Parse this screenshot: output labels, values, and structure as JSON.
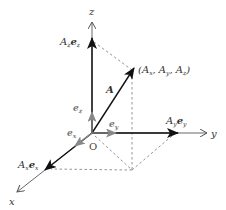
{
  "diagram": {
    "axes": {
      "x_label": "x",
      "y_label": "y",
      "z_label": "z",
      "origin_label": "O"
    },
    "unit_vectors": {
      "ex": "e",
      "ex_sub": "x",
      "ey": "e",
      "ey_sub": "y",
      "ez": "e",
      "ez_sub": "z"
    },
    "components": {
      "x": {
        "coef": "A",
        "coef_sub": "x",
        "vec": "e",
        "vec_sub": "x"
      },
      "y": {
        "coef": "A",
        "coef_sub": "y",
        "vec": "e",
        "vec_sub": "y"
      },
      "z": {
        "coef": "A",
        "coef_sub": "z",
        "vec": "e",
        "vec_sub": "z"
      }
    },
    "vector_label": "A",
    "point_label": "(A",
    "point_parts": [
      "(A",
      "x",
      ", A",
      "y",
      ", A",
      "z",
      ")"
    ],
    "colors": {
      "axis": "#555555",
      "component": "#111111",
      "unit_vector": "#888888",
      "dashed": "#888888"
    }
  }
}
